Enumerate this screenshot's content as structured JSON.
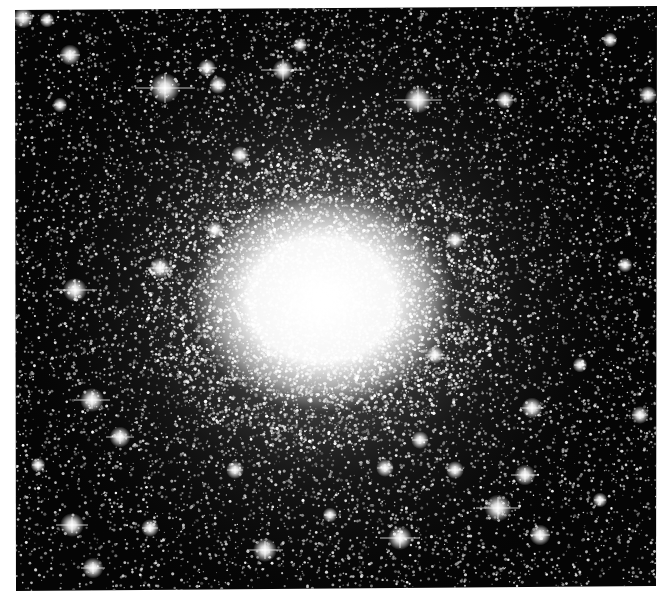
{
  "image": {
    "subject": "globular star cluster",
    "colormode": "grayscale",
    "canvas": {
      "width": 670,
      "height": 604,
      "background": "#ffffff"
    },
    "frame": {
      "corners": [
        [
          15,
          10
        ],
        [
          657,
          6
        ],
        [
          656,
          586
        ],
        [
          16,
          591
        ]
      ],
      "sky_color": "#050505"
    },
    "core": {
      "cx": 322,
      "cy": 300,
      "rx": 95,
      "ry": 80,
      "halo_radius": 330,
      "color": "#ffffff"
    },
    "field_star_count": 16000,
    "bright_stars": [
      {
        "x": 23,
        "y": 18,
        "r": 3.5,
        "spike": 10
      },
      {
        "x": 47,
        "y": 20,
        "r": 2.5,
        "spike": 6
      },
      {
        "x": 70,
        "y": 55,
        "r": 3.5,
        "spike": 10
      },
      {
        "x": 165,
        "y": 88,
        "r": 5,
        "spike": 30
      },
      {
        "x": 207,
        "y": 68,
        "r": 3,
        "spike": 10
      },
      {
        "x": 283,
        "y": 70,
        "r": 3.5,
        "spike": 22
      },
      {
        "x": 218,
        "y": 85,
        "r": 3,
        "spike": 8
      },
      {
        "x": 418,
        "y": 100,
        "r": 4.5,
        "spike": 24
      },
      {
        "x": 505,
        "y": 100,
        "r": 3,
        "spike": 10
      },
      {
        "x": 300,
        "y": 45,
        "r": 2.5,
        "spike": 6
      },
      {
        "x": 648,
        "y": 95,
        "r": 3,
        "spike": 8
      },
      {
        "x": 610,
        "y": 40,
        "r": 2.5,
        "spike": 6
      },
      {
        "x": 75,
        "y": 290,
        "r": 4,
        "spike": 22
      },
      {
        "x": 160,
        "y": 268,
        "r": 3.5,
        "spike": 14
      },
      {
        "x": 92,
        "y": 400,
        "r": 4,
        "spike": 18
      },
      {
        "x": 120,
        "y": 437,
        "r": 3.5,
        "spike": 14
      },
      {
        "x": 60,
        "y": 105,
        "r": 2.5,
        "spike": 6
      },
      {
        "x": 532,
        "y": 408,
        "r": 3.5,
        "spike": 12
      },
      {
        "x": 640,
        "y": 415,
        "r": 3,
        "spike": 8
      },
      {
        "x": 498,
        "y": 508,
        "r": 4.5,
        "spike": 22
      },
      {
        "x": 525,
        "y": 475,
        "r": 3.5,
        "spike": 14
      },
      {
        "x": 400,
        "y": 538,
        "r": 4,
        "spike": 20
      },
      {
        "x": 540,
        "y": 535,
        "r": 3.5,
        "spike": 10
      },
      {
        "x": 265,
        "y": 550,
        "r": 4,
        "spike": 18
      },
      {
        "x": 93,
        "y": 568,
        "r": 3.5,
        "spike": 12
      },
      {
        "x": 72,
        "y": 525,
        "r": 4,
        "spike": 16
      },
      {
        "x": 150,
        "y": 528,
        "r": 3,
        "spike": 8
      },
      {
        "x": 435,
        "y": 355,
        "r": 3,
        "spike": 10
      },
      {
        "x": 600,
        "y": 500,
        "r": 2.5,
        "spike": 6
      },
      {
        "x": 455,
        "y": 470,
        "r": 3,
        "spike": 8
      },
      {
        "x": 385,
        "y": 468,
        "r": 3,
        "spike": 8
      },
      {
        "x": 420,
        "y": 440,
        "r": 3,
        "spike": 8
      },
      {
        "x": 235,
        "y": 470,
        "r": 3,
        "spike": 8
      },
      {
        "x": 625,
        "y": 265,
        "r": 2.5,
        "spike": 6
      },
      {
        "x": 580,
        "y": 365,
        "r": 2.5,
        "spike": 6
      },
      {
        "x": 38,
        "y": 465,
        "r": 2.5,
        "spike": 6
      },
      {
        "x": 330,
        "y": 515,
        "r": 2.5,
        "spike": 6
      },
      {
        "x": 455,
        "y": 240,
        "r": 3,
        "spike": 10
      },
      {
        "x": 215,
        "y": 230,
        "r": 3,
        "spike": 10
      },
      {
        "x": 240,
        "y": 155,
        "r": 3,
        "spike": 8
      }
    ]
  }
}
